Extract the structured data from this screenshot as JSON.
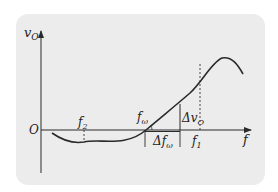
{
  "diagram": {
    "type": "frequency-discriminator characteristic curve",
    "axes": {
      "y_label": "v",
      "y_label_sub": "O",
      "x_label": "f",
      "origin_label": "O"
    },
    "labels": {
      "f2": {
        "text": "f",
        "sub": "2"
      },
      "f1": {
        "text": "f",
        "sub": "1"
      },
      "f_omega": {
        "text": "f",
        "sub": "ω"
      },
      "delta_v": {
        "prefix": "Δ",
        "text": "v",
        "sub": "O"
      },
      "delta_f": {
        "prefix": "Δ",
        "text": "f",
        "sub": "ω"
      }
    },
    "colors": {
      "background": "#ffffff",
      "panel": "#ececec",
      "stroke": "#2a2a2a"
    }
  }
}
